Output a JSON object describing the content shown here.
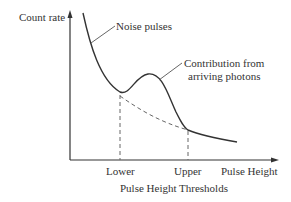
{
  "diagram": {
    "y_axis_label": "Count rate",
    "x_axis_label": "Pulse Height",
    "x_title": "Pulse Height Thresholds",
    "ticks": {
      "lower": "Lower",
      "upper": "Upper"
    },
    "annotations": {
      "noise": "Noise pulses",
      "contribution_line1": "Contribution from",
      "contribution_line2": "arriving photons"
    },
    "colors": {
      "curve": "#333333",
      "axis": "#333333",
      "dashed": "#666666"
    }
  }
}
